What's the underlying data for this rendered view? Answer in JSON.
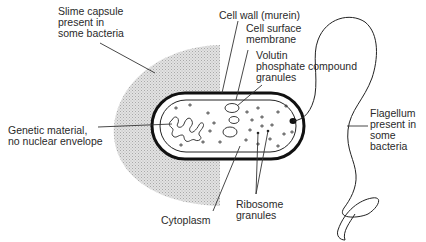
{
  "labels": {
    "slime_capsule": "Slime capsule\npresent in\nsome bacteria",
    "cell_wall": "Cell wall (murein)",
    "cell_membrane": "Cell surface\nmembrane",
    "volutin": "Volutin\nphosphate compound\ngranules",
    "genetic_material": "Genetic material,\nno nuclear envelope",
    "flagellum": "Flagellum\npresent in\nsome\nbacteria",
    "ribosome": "Ribosome\ngranules",
    "cytoplasm": "Cytoplasm"
  },
  "colors": {
    "capsule": "#d2d2d2",
    "outline": "#111111",
    "leader": "#333333",
    "text": "#2a2a2a"
  }
}
